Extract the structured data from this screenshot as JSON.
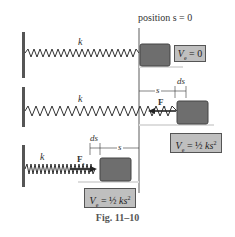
{
  "figure": {
    "caption": "Fig. 11–10",
    "reference_line_label": "position s = 0",
    "colors": {
      "block": "#6e6e6e",
      "block_border": "#444444",
      "wall": "#555555",
      "spring": "#333333",
      "label_box_bg": "#bfbfbf",
      "shadow": "#dddddd"
    },
    "panels": [
      {
        "name": "equilibrium",
        "spring_label": "k",
        "energy_label": "Ve = 0"
      },
      {
        "name": "stretched",
        "spring_label": "k",
        "force_label": "Fs",
        "displacement_label": "s",
        "increment_label": "ds",
        "energy_label": "Ve = ½ ks²"
      },
      {
        "name": "compressed",
        "spring_label": "k",
        "force_label": "Fs",
        "displacement_label": "s",
        "increment_label": "ds",
        "energy_label": "Ve = ½ ks²"
      }
    ]
  }
}
